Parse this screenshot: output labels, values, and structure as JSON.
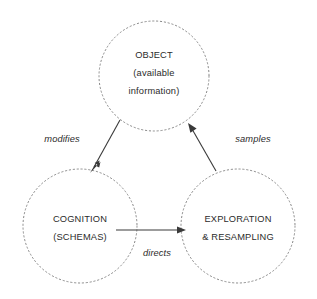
{
  "diagram": {
    "background_color": "#ffffff",
    "node_stroke_color": "#8a8a8a",
    "edge_color": "#3a3a3a",
    "text_color": "#2b2b2b",
    "nodes": [
      {
        "id": "object",
        "lines": [
          "OBJECT",
          "(available",
          "information)"
        ],
        "cx": 154,
        "cy": 76,
        "r": 55
      },
      {
        "id": "cognition",
        "lines": [
          "COGNITION",
          "(SCHEMAS)"
        ],
        "cx": 80,
        "cy": 226,
        "r": 57
      },
      {
        "id": "exploration",
        "lines": [
          "EXPLORATION",
          "& RESAMPLING"
        ],
        "cx": 238,
        "cy": 226,
        "r": 57
      }
    ],
    "edges": [
      {
        "id": "modifies",
        "label": "modifies",
        "from": "object",
        "to": "cognition",
        "label_x": 62,
        "label_y": 142
      },
      {
        "id": "directs",
        "label": "directs",
        "from": "cognition",
        "to": "exploration",
        "label_x": 157,
        "label_y": 256
      },
      {
        "id": "samples",
        "label": "samples",
        "from": "exploration",
        "to": "object",
        "label_x": 253,
        "label_y": 142
      }
    ]
  }
}
